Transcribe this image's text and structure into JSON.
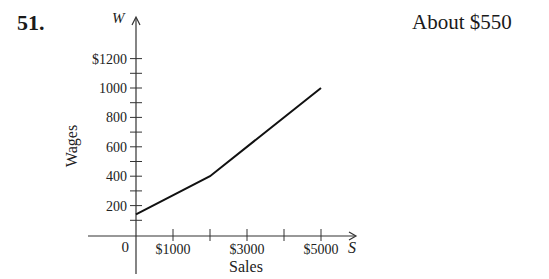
{
  "problem_number": "51.",
  "answer": "About $550",
  "chart_data": {
    "type": "line",
    "title": "",
    "xlabel": "Sales",
    "ylabel": "Wages",
    "x_axis_var": "S",
    "y_axis_var": "W",
    "x": [
      0,
      2000,
      5000
    ],
    "series": [
      {
        "name": "Wages",
        "values": [
          140,
          400,
          1000
        ]
      }
    ],
    "x_ticks": [
      1000,
      2000,
      3000,
      4000,
      5000
    ],
    "x_tick_labels": [
      "$1000",
      "$3000",
      "$5000"
    ],
    "y_ticks": [
      100,
      200,
      300,
      400,
      500,
      600,
      700,
      800,
      900,
      1000,
      1100,
      1200
    ],
    "y_tick_labels": [
      "200",
      "400",
      "600",
      "800",
      "1000",
      "$1200"
    ],
    "origin_label": "0",
    "xlim": [
      0,
      5500
    ],
    "ylim": [
      0,
      1300
    ],
    "grid": false,
    "legend": "none"
  }
}
